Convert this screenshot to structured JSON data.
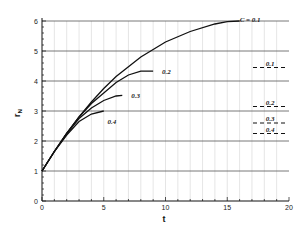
{
  "chart_data": {
    "type": "line",
    "title": "",
    "xlabel": "t",
    "ylabel": "r_N",
    "xlim": [
      0,
      20
    ],
    "ylim": [
      0,
      6
    ],
    "xticks": [
      0,
      5,
      10,
      15,
      20
    ],
    "yticks": [
      0,
      1,
      2,
      3,
      4,
      5,
      6
    ],
    "grid": true,
    "series": [
      {
        "name": "C = 0.1",
        "label": "C = 0.1",
        "x": [
          0,
          1,
          2,
          3,
          4,
          5,
          6,
          8,
          10,
          12,
          14,
          15,
          16
        ],
        "y": [
          1,
          1.65,
          2.25,
          2.8,
          3.3,
          3.75,
          4.15,
          4.8,
          5.3,
          5.65,
          5.9,
          5.98,
          6.0
        ]
      },
      {
        "name": "0.2",
        "label": "0.2",
        "x": [
          0,
          1,
          2,
          3,
          4,
          5,
          6,
          7,
          8,
          9
        ],
        "y": [
          1,
          1.65,
          2.25,
          2.8,
          3.25,
          3.6,
          3.95,
          4.2,
          4.33,
          4.33
        ]
      },
      {
        "name": "0.3",
        "label": "0.3",
        "x": [
          0,
          1,
          2,
          3,
          4,
          5,
          6,
          6.5
        ],
        "y": [
          1,
          1.65,
          2.25,
          2.75,
          3.1,
          3.35,
          3.5,
          3.52
        ]
      },
      {
        "name": "0.4",
        "label": "0.4",
        "x": [
          0,
          1,
          2,
          3,
          4,
          5
        ],
        "y": [
          1,
          1.65,
          2.2,
          2.65,
          2.9,
          3.0
        ]
      }
    ],
    "reference_lines": [
      {
        "label": "0.1",
        "y": 4.45,
        "style": "dashed"
      },
      {
        "label": "0.2",
        "y": 3.15,
        "style": "dashed"
      },
      {
        "label": "0.3",
        "y": 2.6,
        "style": "dashed"
      },
      {
        "label": "0.4",
        "y": 2.25,
        "style": "dashed"
      }
    ]
  }
}
